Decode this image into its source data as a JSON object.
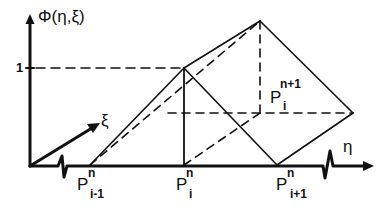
{
  "diagram": {
    "axis_vertical_label": "Φ(η,ξ)",
    "axis_horizontal_label": "η",
    "axis_depth_label": "ξ",
    "level_tick_label": "1",
    "nodes": [
      {
        "id": "p_i_minus_1_n",
        "base": "P",
        "sup": "n",
        "sub": "i-1"
      },
      {
        "id": "p_i_n",
        "base": "P",
        "sup": "n",
        "sub": "i"
      },
      {
        "id": "p_i_plus_1_n",
        "base": "P",
        "sup": "n",
        "sub": "i+1"
      },
      {
        "id": "p_i_n_plus_1",
        "base": "P",
        "sup": "n+1",
        "sub": "i"
      }
    ],
    "colors": {
      "ink": "#111111",
      "background": "#ffffff"
    }
  }
}
